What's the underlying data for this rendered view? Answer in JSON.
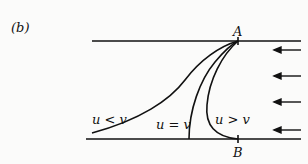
{
  "figure": {
    "panel_label": "(b)",
    "point_top": "A",
    "point_bottom": "B",
    "curve_labels": {
      "less": "u < v",
      "equal": "u = v",
      "greater": "u > v"
    },
    "arrow_count": 4,
    "arrow_direction": "left",
    "line_color": "#111111"
  }
}
